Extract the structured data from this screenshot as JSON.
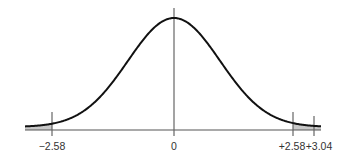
{
  "diagram": {
    "type": "normal-distribution-curve",
    "shaded_regions": [
      "left-tail-below--2.58",
      "right-tail-above-+2.58"
    ],
    "tick_labels": [
      "−2.58",
      "0",
      "+2.58",
      "+3.04"
    ],
    "tick_values": [
      -2.58,
      0,
      2.58,
      3.04
    ],
    "colors": {
      "curve": "#111111",
      "axis": "#555555",
      "shade": "#c8c8c8"
    }
  }
}
